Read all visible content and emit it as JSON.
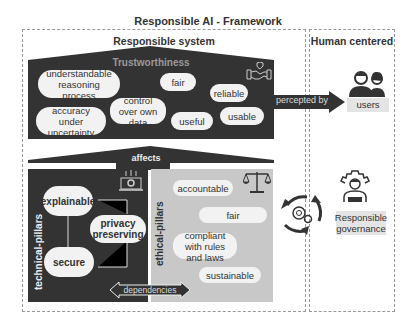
{
  "title": "Responsible AI - Framework",
  "responsible_system": {
    "title": "Responsible system",
    "trustworthiness": {
      "label": "Trustworthiness",
      "icon": "handshake-shield-icon",
      "items": [
        "understandable reasoning process",
        "fair",
        "reliable",
        "control over own data",
        "accuracy under uncertainty",
        "useful",
        "usable"
      ]
    },
    "affects_label": "affects",
    "technical_pillars": {
      "label": "technical-pillars",
      "icon": "laptop-gear-icon",
      "items": [
        "explainable",
        "privacy preserving",
        "secure"
      ]
    },
    "ethical_pillars": {
      "label": "ethical-pillars",
      "icon": "scales-icon",
      "items": [
        "accountable",
        "fair",
        "compliant with rules and laws",
        "sustainable"
      ]
    },
    "dependencies_label": "dependencies"
  },
  "human_centered": {
    "title": "Human centered",
    "perceived_label": "percepted by",
    "users_label": "users",
    "governance_label": "Responsible governance"
  },
  "colors": {
    "dark": "#333333",
    "grey": "#c8c8c8",
    "pill": "#f2f2f2",
    "label_bg": "#e4e4e4"
  }
}
